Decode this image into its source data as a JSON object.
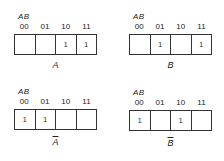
{
  "row_variable_label": "AB",
  "columns": [
    "00",
    "01",
    "10",
    "11"
  ],
  "maps": [
    {
      "name": "A",
      "complement": false,
      "cells": [
        "",
        "",
        "1",
        "1"
      ]
    },
    {
      "name": "B",
      "complement": false,
      "cells": [
        "",
        "1",
        "",
        "1"
      ]
    },
    {
      "name": "A",
      "complement": true,
      "display": "Ā",
      "cells": [
        "1",
        "1",
        "",
        ""
      ]
    },
    {
      "name": "B",
      "complement": true,
      "display": "B̄",
      "cells": [
        "1",
        "",
        "1",
        ""
      ]
    }
  ]
}
